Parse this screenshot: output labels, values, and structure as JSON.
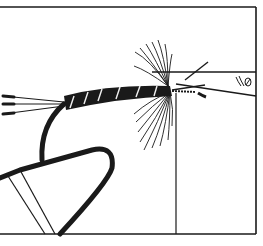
{
  "illustration": {
    "subject": "fly-tying-hook-in-vise-line-drawing",
    "colors": {
      "background": "#ffffff",
      "ink": "#1a1a1a",
      "rib": "#f2f2f2"
    },
    "elements": [
      "frame-border",
      "vise-jaw",
      "vise-stand",
      "hook-bend",
      "wrapped-body",
      "tail-fibers",
      "hackle-fibers-upper",
      "hackle-fibers-lower",
      "bobbin-clamp"
    ]
  }
}
